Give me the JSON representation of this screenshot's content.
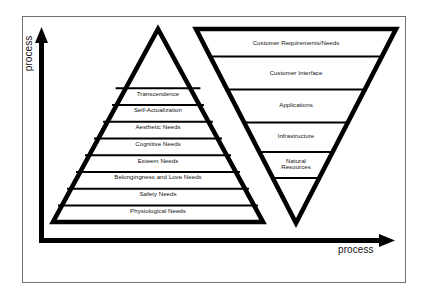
{
  "figure": {
    "background_color": "#ffffff",
    "frame_color": "#6f6f6f",
    "ink_color": "#000000",
    "text_color": "#111111"
  },
  "axes": {
    "y_label": "process",
    "x_label": "process",
    "arrow_color": "#000000"
  },
  "pyramid": {
    "name": "maslow-pyramid",
    "orientation": "upright",
    "apex_blank_rows": 1,
    "levels": [
      {
        "label": "Transcendence"
      },
      {
        "label": "Self-Actualization"
      },
      {
        "label": "Aesthetic Needs"
      },
      {
        "label": "Cognitive Needs"
      },
      {
        "label": "Esteem Needs"
      },
      {
        "label": "Belongingness and Love Needs"
      },
      {
        "label": "Safety Needs"
      },
      {
        "label": "Physiological Needs"
      }
    ]
  },
  "inverted_triangle": {
    "name": "customer-value-triangle",
    "orientation": "inverted",
    "levels": [
      {
        "label": "Customer Requirements/Needs"
      },
      {
        "label": "Customer Interface"
      },
      {
        "label": "Applications"
      },
      {
        "label": "Infrastructure"
      },
      {
        "label": "Natural Resources",
        "line1": "Natural",
        "line2": "Resources"
      }
    ]
  }
}
